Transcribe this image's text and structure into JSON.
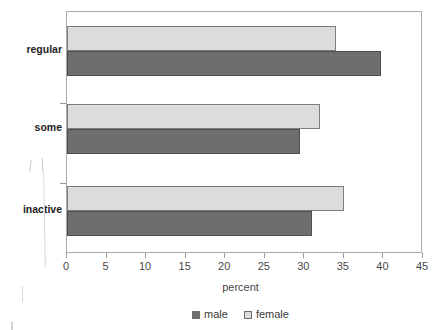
{
  "chart_data": {
    "type": "bar",
    "orientation": "horizontal",
    "title": "",
    "xlabel": "percent",
    "ylabel": "",
    "categories": [
      "regular",
      "some",
      "inactive"
    ],
    "series": [
      {
        "name": "male",
        "color": "#6e6e6e",
        "values": [
          39.7,
          29.5,
          31.0
        ]
      },
      {
        "name": "female",
        "color": "#dcdcdc",
        "values": [
          34.0,
          32.0,
          35.0
        ]
      }
    ],
    "xlim": [
      0,
      45
    ],
    "xticks": [
      0,
      5,
      10,
      15,
      20,
      25,
      30,
      35,
      40,
      45
    ],
    "xtick_labels": [
      "0",
      "5",
      "10",
      "15",
      "20",
      "25",
      "30",
      "35",
      "40",
      "45"
    ],
    "grid": false,
    "legend": {
      "position": "bottom",
      "entries": [
        "male",
        "female"
      ]
    }
  },
  "legend": {
    "items": [
      {
        "label": "male",
        "swatch": "male-swatch-icon"
      },
      {
        "label": "female",
        "swatch": "female-swatch-icon"
      }
    ]
  },
  "axis": {
    "x_title": "percent"
  },
  "colors": {
    "male": "#6e6e6e",
    "female": "#dcdcdc",
    "frame": "#a9a9a9",
    "text": "#3a3a3a"
  }
}
